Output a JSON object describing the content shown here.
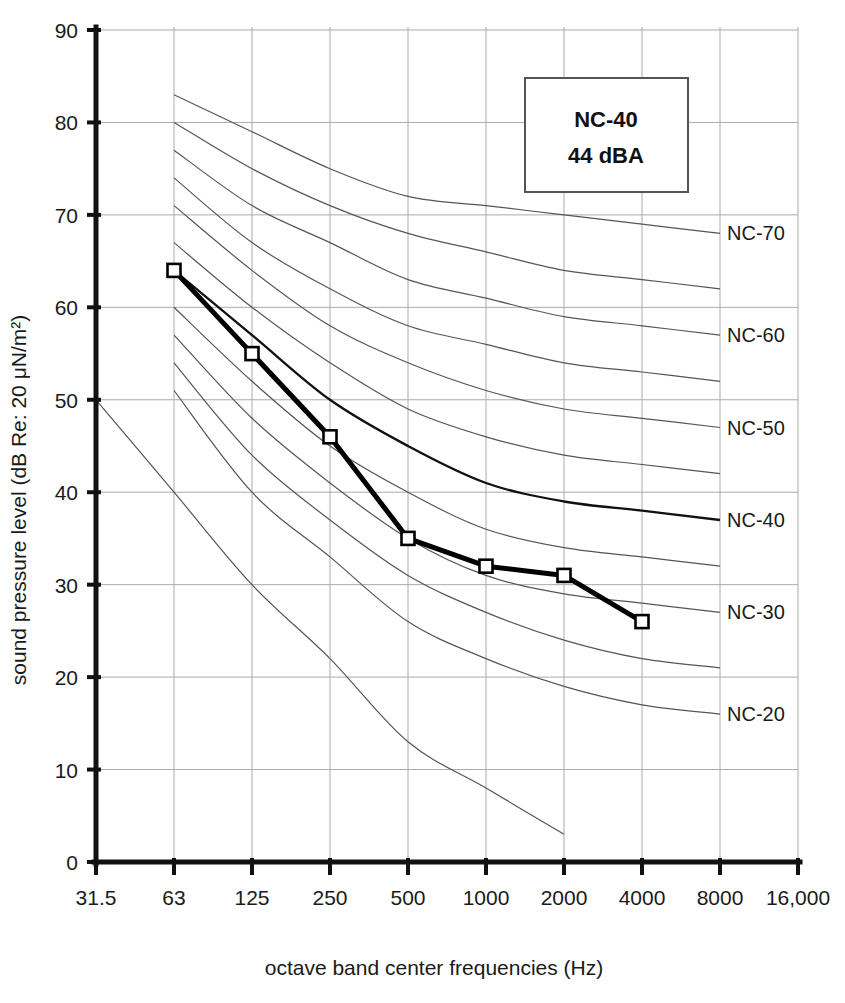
{
  "chart_data": {
    "type": "line",
    "title": "",
    "xlabel": "octave band center frequencies (Hz)",
    "ylabel": "sound pressure level (dB Re: 20 μN/m²)",
    "x_tick_labels": [
      "31.5",
      "63",
      "125",
      "250",
      "500",
      "1000",
      "2000",
      "4000",
      "8000",
      "16,000"
    ],
    "x_tick_values": [
      31.5,
      63,
      125,
      250,
      500,
      1000,
      2000,
      4000,
      8000,
      16000
    ],
    "y_tick_labels": [
      "0",
      "10",
      "20",
      "30",
      "40",
      "50",
      "60",
      "70",
      "80",
      "90"
    ],
    "y_tick_values": [
      0,
      10,
      20,
      30,
      40,
      50,
      60,
      70,
      80,
      90
    ],
    "ylim": [
      0,
      90
    ],
    "grid": true,
    "legend_position": "top-right-inset",
    "series": [
      {
        "name": "measured spectrum",
        "marker": "open-square",
        "categories": [
          "63",
          "125",
          "250",
          "500",
          "1000",
          "2000",
          "4000"
        ],
        "x": [
          63,
          125,
          250,
          500,
          1000,
          2000,
          4000
        ],
        "values": [
          64,
          55,
          46,
          35,
          32,
          31,
          26
        ]
      }
    ],
    "nc_curves": [
      {
        "name": "NC-70",
        "label": "NC-70",
        "x": [
          63,
          125,
          250,
          500,
          1000,
          2000,
          4000,
          8000
        ],
        "values": [
          83,
          79,
          75,
          72,
          71,
          70,
          69,
          68
        ],
        "highlight": false
      },
      {
        "name": "NC-65",
        "label": "",
        "x": [
          63,
          125,
          250,
          500,
          1000,
          2000,
          4000,
          8000
        ],
        "values": [
          80,
          75,
          71,
          68,
          66,
          64,
          63,
          62
        ],
        "highlight": false
      },
      {
        "name": "NC-60",
        "label": "NC-60",
        "x": [
          63,
          125,
          250,
          500,
          1000,
          2000,
          4000,
          8000
        ],
        "values": [
          77,
          71,
          67,
          63,
          61,
          59,
          58,
          57
        ],
        "highlight": false
      },
      {
        "name": "NC-55",
        "label": "",
        "x": [
          63,
          125,
          250,
          500,
          1000,
          2000,
          4000,
          8000
        ],
        "values": [
          74,
          67,
          62,
          58,
          56,
          54,
          53,
          52
        ],
        "highlight": false
      },
      {
        "name": "NC-50",
        "label": "NC-50",
        "x": [
          63,
          125,
          250,
          500,
          1000,
          2000,
          4000,
          8000
        ],
        "values": [
          71,
          64,
          58,
          54,
          51,
          49,
          48,
          47
        ],
        "highlight": false
      },
      {
        "name": "NC-45",
        "label": "",
        "x": [
          63,
          125,
          250,
          500,
          1000,
          2000,
          4000,
          8000
        ],
        "values": [
          67,
          60,
          54,
          49,
          46,
          44,
          43,
          42
        ],
        "highlight": false
      },
      {
        "name": "NC-40",
        "label": "NC-40",
        "x": [
          63,
          125,
          250,
          500,
          1000,
          2000,
          4000,
          8000
        ],
        "values": [
          64,
          57,
          50,
          45,
          41,
          39,
          38,
          37
        ],
        "highlight": true
      },
      {
        "name": "NC-35",
        "label": "",
        "x": [
          63,
          125,
          250,
          500,
          1000,
          2000,
          4000,
          8000
        ],
        "values": [
          60,
          52,
          45,
          40,
          36,
          34,
          33,
          32
        ],
        "highlight": false
      },
      {
        "name": "NC-30",
        "label": "NC-30",
        "x": [
          63,
          125,
          250,
          500,
          1000,
          2000,
          4000,
          8000
        ],
        "values": [
          57,
          48,
          41,
          35,
          31,
          29,
          28,
          27
        ],
        "highlight": false
      },
      {
        "name": "NC-25",
        "label": "",
        "x": [
          63,
          125,
          250,
          500,
          1000,
          2000,
          4000,
          8000
        ],
        "values": [
          54,
          44,
          37,
          31,
          27,
          24,
          22,
          21
        ],
        "highlight": false
      },
      {
        "name": "NC-20",
        "label": "NC-20",
        "x": [
          63,
          125,
          250,
          500,
          1000,
          2000,
          4000,
          8000
        ],
        "values": [
          51,
          40,
          33,
          26,
          22,
          19,
          17,
          16
        ],
        "highlight": false
      },
      {
        "name": "NC-15",
        "label": "",
        "x": [
          31.5,
          63,
          125,
          250,
          500,
          1000,
          2000
        ],
        "values": [
          50,
          40,
          30,
          22,
          13,
          8,
          3
        ],
        "highlight": false
      }
    ],
    "nc_right_labels": [
      {
        "text": "NC-70",
        "y": 68
      },
      {
        "text": "NC-60",
        "y": 57
      },
      {
        "text": "NC-50",
        "y": 47
      },
      {
        "text": "NC-40",
        "y": 37
      },
      {
        "text": "NC-30",
        "y": 27
      },
      {
        "text": "NC-20",
        "y": 16
      }
    ],
    "annotation_box": {
      "line1": "NC-40",
      "line2": "44 dBA"
    },
    "colors": {
      "axis": "#111111",
      "grid": "#aaaaaa",
      "nc_curve": "#555555",
      "series": "#000000",
      "marker_fill": "#ffffff",
      "text": "#1a1a1a"
    }
  }
}
